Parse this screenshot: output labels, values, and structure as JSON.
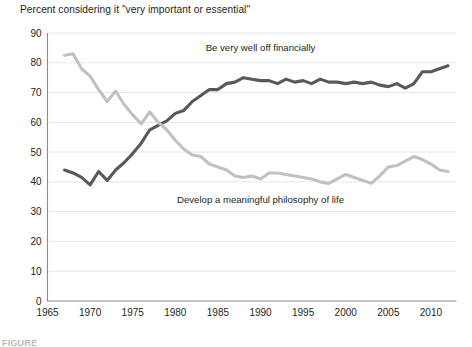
{
  "figure": {
    "caption": "FIGURE"
  },
  "chart_data": {
    "type": "line",
    "title": "Percent considering it \"very important or essential\"",
    "xlabel": "",
    "ylabel": "",
    "xlim": [
      1965,
      2013
    ],
    "ylim": [
      0,
      90
    ],
    "ytick_values": [
      0,
      10,
      20,
      30,
      40,
      50,
      60,
      70,
      80,
      90
    ],
    "ytick_labels": [
      "0",
      "10",
      "20",
      "30",
      "40",
      "50",
      "60",
      "70",
      "80",
      "90"
    ],
    "xtick_values": [
      1965,
      1970,
      1975,
      1980,
      1985,
      1990,
      1995,
      2000,
      2005,
      2010
    ],
    "xtick_labels": [
      "1965",
      "1970",
      "1975",
      "1980",
      "1985",
      "1990",
      "1995",
      "2000",
      "2005",
      "2010"
    ],
    "grid": "horizontal",
    "legend_position": "inline-annotation",
    "series": [
      {
        "name": "Be very well off financially",
        "color": "#595959",
        "label_x": 1990,
        "label_y": 84,
        "x": [
          1967,
          1968,
          1969,
          1970,
          1971,
          1972,
          1973,
          1974,
          1975,
          1976,
          1977,
          1978,
          1979,
          1980,
          1981,
          1982,
          1983,
          1984,
          1985,
          1986,
          1987,
          1988,
          1989,
          1990,
          1991,
          1992,
          1993,
          1994,
          1995,
          1996,
          1997,
          1998,
          1999,
          2000,
          2001,
          2002,
          2003,
          2004,
          2005,
          2006,
          2007,
          2008,
          2009,
          2010,
          2011,
          2012
        ],
        "values": [
          44.0,
          43.0,
          41.5,
          39.0,
          43.5,
          40.5,
          44.0,
          46.5,
          49.5,
          53.0,
          57.5,
          59.0,
          60.5,
          63.0,
          64.0,
          67.0,
          69.0,
          71.0,
          71.0,
          73.0,
          73.5,
          75.0,
          74.5,
          74.0,
          74.0,
          73.0,
          74.5,
          73.5,
          74.0,
          73.0,
          74.5,
          73.5,
          73.5,
          73.0,
          73.5,
          73.0,
          73.5,
          72.5,
          72.0,
          73.0,
          71.5,
          73.0,
          77.0,
          77.0,
          78.0,
          79.0
        ]
      },
      {
        "name": "Develop a meaningful philosophy of life",
        "color": "#c1c1c1",
        "label_x": 1990,
        "label_y": 33,
        "x": [
          1967,
          1968,
          1969,
          1970,
          1971,
          1972,
          1973,
          1974,
          1975,
          1976,
          1977,
          1978,
          1979,
          1980,
          1981,
          1982,
          1983,
          1984,
          1985,
          1986,
          1987,
          1988,
          1989,
          1990,
          1991,
          1992,
          1993,
          1994,
          1995,
          1996,
          1997,
          1998,
          1999,
          2000,
          2001,
          2002,
          2003,
          2004,
          2005,
          2006,
          2007,
          2008,
          2009,
          2010,
          2011,
          2012
        ],
        "values": [
          82.5,
          83.0,
          78.0,
          75.5,
          71.0,
          67.0,
          70.5,
          66.0,
          62.5,
          59.5,
          63.5,
          60.0,
          57.5,
          54.0,
          51.0,
          49.0,
          48.5,
          46.0,
          45.0,
          44.0,
          42.0,
          41.5,
          42.0,
          41.0,
          43.0,
          43.0,
          42.5,
          42.0,
          41.5,
          41.0,
          40.0,
          39.5,
          41.0,
          42.5,
          41.5,
          40.5,
          39.5,
          42.0,
          45.0,
          45.5,
          47.0,
          48.5,
          47.5,
          46.0,
          44.0,
          43.5
        ]
      }
    ]
  }
}
